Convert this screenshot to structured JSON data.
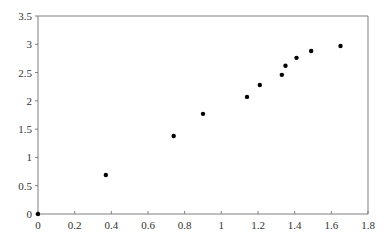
{
  "chart_data": {
    "type": "scatter",
    "title": "",
    "xlabel": "",
    "ylabel": "",
    "xlim": [
      0,
      1.8
    ],
    "ylim": [
      0,
      3.5
    ],
    "grid": false,
    "legend": null,
    "x_ticks": [
      "0",
      "0.2",
      "0.4",
      "0.6",
      "0.8",
      "1",
      "1.2",
      "1.4",
      "1.6",
      "1.8"
    ],
    "y_ticks": [
      "0",
      "0.5",
      "1",
      "1.5",
      "2",
      "2.5",
      "3",
      "3.5"
    ],
    "series": [
      {
        "name": "data",
        "color": "#000000",
        "points": [
          {
            "x": 0.0,
            "y": 0.0
          },
          {
            "x": 0.37,
            "y": 0.69
          },
          {
            "x": 0.74,
            "y": 1.38
          },
          {
            "x": 0.9,
            "y": 1.77
          },
          {
            "x": 1.14,
            "y": 2.07
          },
          {
            "x": 1.21,
            "y": 2.28
          },
          {
            "x": 1.33,
            "y": 2.46
          },
          {
            "x": 1.35,
            "y": 2.62
          },
          {
            "x": 1.41,
            "y": 2.76
          },
          {
            "x": 1.49,
            "y": 2.88
          },
          {
            "x": 1.65,
            "y": 2.97
          }
        ]
      }
    ]
  },
  "style": {
    "axis_color": "#7f7f7f",
    "point_color": "#000000",
    "label_color": "#333333"
  }
}
